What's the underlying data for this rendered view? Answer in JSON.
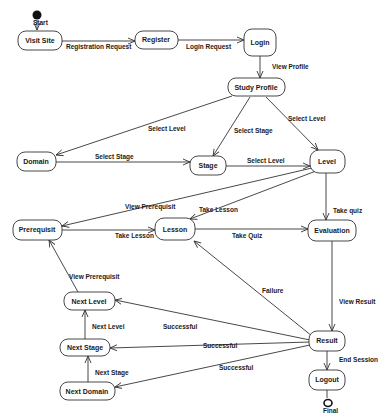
{
  "diagram": {
    "type": "state-diagram",
    "start_label": "Start",
    "final_label": "Final",
    "colors": {
      "line": "#333333",
      "text": "#1a1a1a",
      "background": "#ffffff"
    },
    "nodes": {
      "visit_site": "Visit Site",
      "register": "Register",
      "login": "Login",
      "study_profile": "Study Profile",
      "domain": "Domain",
      "stage": "Stage",
      "level": "Level",
      "prerequisit": "Prerequisit",
      "lesson": "Lesson",
      "evaluation": "Evaluation",
      "next_level": "Next Level",
      "next_stage": "Next Stage",
      "next_domain": "Next Domain",
      "result": "Result",
      "logout": "Logout"
    },
    "edges": {
      "registration_request": "Registration Request",
      "login_request": "Login Request",
      "view_profile": "View Profile",
      "profile_select_level_domain": "Select Level",
      "profile_select_stage": "Select Stage",
      "profile_select_level": "Select Level",
      "domain_select_stage": "Select Stage",
      "stage_select_level": "Select Level",
      "level_view_prerequisit": "View Prerequisit",
      "level_take_lesson": "Take Lesson",
      "level_take_quiz": "Take quiz",
      "prereq_take_lesson": "Take Lesson",
      "lesson_take_quiz": "Take Quiz",
      "view_result": "View Result",
      "failure": "Failure",
      "successful_next_level": "Successful",
      "successful_next_stage": "Successful",
      "successful_next_domain": "Successful",
      "end_session": "End Session",
      "next_level_view_prerequisit": "View Prerequisit",
      "next_stage_next_level": "Next Level",
      "next_domain_next_stage": "Next Stage"
    }
  }
}
